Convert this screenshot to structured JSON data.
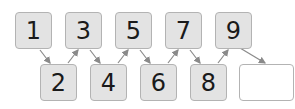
{
  "sequence": {
    "top_row": [
      {
        "value": "1",
        "x": 15,
        "y": 12
      },
      {
        "value": "3",
        "x": 65,
        "y": 12
      },
      {
        "value": "5",
        "x": 115,
        "y": 12
      },
      {
        "value": "7",
        "x": 165,
        "y": 12
      },
      {
        "value": "9",
        "x": 215,
        "y": 12
      }
    ],
    "bottom_row": [
      {
        "value": "2",
        "x": 40,
        "y": 64
      },
      {
        "value": "4",
        "x": 90,
        "y": 64
      },
      {
        "value": "6",
        "x": 140,
        "y": 64
      },
      {
        "value": "8",
        "x": 190,
        "y": 64
      },
      {
        "value": "",
        "x": 239,
        "y": 64
      }
    ],
    "arrow_color": "#8a8a8a",
    "box_fill": "#e3e3e3",
    "box_border": "#b3b3b3"
  }
}
